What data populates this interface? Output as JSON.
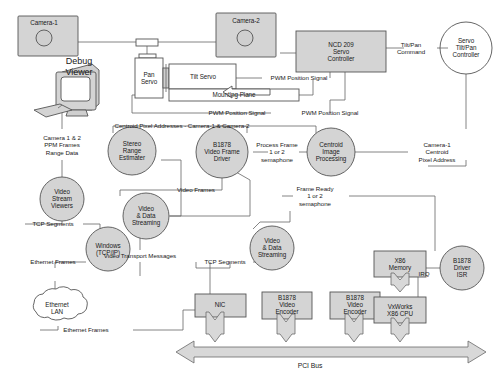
{
  "diagram": {
    "colors": {
      "node_fill": "#d4d4d4",
      "white_fill": "#ffffff",
      "stroke": "#555555",
      "connector": "#666666",
      "bus_fill": "#d8d8d8",
      "text": "#1a1a1a"
    },
    "nodes": {
      "camera_1": {
        "label": "Camera-1",
        "shape": "box-with-lens"
      },
      "camera_2": {
        "label": "Camera-2",
        "shape": "box-with-lens"
      },
      "debug_viewer": {
        "label": "Debug\nViewer",
        "shape": "crt-monitor"
      },
      "pan_servo": {
        "label": "Pan\nServo",
        "shape": "box"
      },
      "tilt_servo": {
        "label": "Tilt Servo",
        "shape": "box"
      },
      "mounting_plane": {
        "label": "Mounting Plane",
        "shape": "box"
      },
      "ncd_209": {
        "label": "NCD 209\nServo\nController",
        "shape": "box"
      },
      "servo_tilt_pan_controller": {
        "label": "Servo\nTilt/Pan\nController",
        "shape": "circle"
      },
      "video_stream_viewers": {
        "label": "Video\nStream\nViewers",
        "shape": "circle"
      },
      "stereo_range_estimator": {
        "label": "Stereo\nRange\nEstimater",
        "shape": "circle"
      },
      "b1878_video_frame_driver": {
        "label": "B1878\nVideo Frame\nDriver",
        "shape": "circle"
      },
      "centroid_image_processing": {
        "label": "Centroid\nImage\nProcessing",
        "shape": "circle"
      },
      "video_data_streaming_left": {
        "label": "Video\n& Data\nStreaming",
        "shape": "circle"
      },
      "video_data_streaming_right": {
        "label": "Video\n& Data\nStreaming",
        "shape": "circle"
      },
      "windows_tcpip": {
        "label": "Windows\n(TCP/IP)",
        "shape": "circle"
      },
      "ethernet_lan": {
        "label": "Ethernet\nLAN",
        "shape": "cloud"
      },
      "b1878_driver_isr": {
        "label": "B1878\nDriver\nISR",
        "shape": "circle"
      },
      "nic": {
        "label": "NIC",
        "shape": "box"
      },
      "b1878_video_encoder_1": {
        "label": "B1878\nVideo\nEncoder",
        "shape": "box"
      },
      "b1878_video_encoder_2": {
        "label": "B1878\nVideo\nEncoder",
        "shape": "box"
      },
      "x86_memory": {
        "label": "X86\nMemory",
        "shape": "box"
      },
      "vxworks_x86_cpu": {
        "label": "VxWorks\nX86 CPU",
        "shape": "box"
      },
      "pci_bus": {
        "label": "PCI Bus",
        "shape": "double-arrow"
      }
    },
    "edge_labels": {
      "pwm_position_signal_1": "PWM Position Signal",
      "pwm_position_signal_2": "PWM Position Signal",
      "pwm_position_signal_3": "PWM Position Signal",
      "tilt_pan_command": "Tilt/Pan\nCommand",
      "centroid_pixel_addresses": "Centroid Pixel Addresses - Camera-1 & Camera-2",
      "camera_1_2_ppm": "Camera 1 & 2\nPPM Frames\nRange Data",
      "process_frame_semaphore": "Process Frame\n1 or 2\nsemaphone",
      "camera_1_centroid_pixel_address": "Camera-1\nCentroid\nPixel Address",
      "video_frames": "Video Frames",
      "frame_ready_semaphore": "Frame Ready\n1 or 2\nsemaphone",
      "tcp_segments_left": "TCP Segments",
      "tcp_segments_right": "TCP Segments",
      "video_transport_messages": "Video Transport Messages",
      "ethernet_frames_upper": "Ethernet Frames",
      "ethernet_frames_lower": "Ethernet Frames",
      "irq": "IRQ"
    }
  }
}
